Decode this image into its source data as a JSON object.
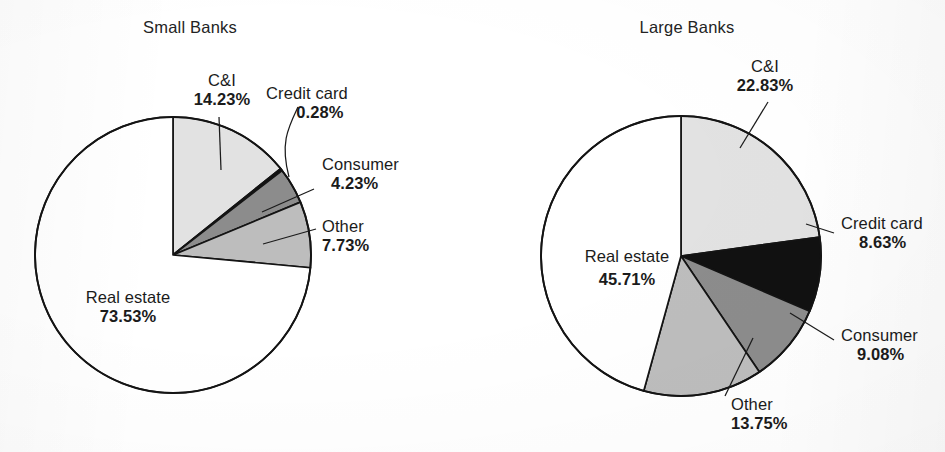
{
  "chart_data": [
    {
      "type": "pie",
      "title": "Small Banks",
      "categories": [
        "C&I",
        "Credit card",
        "Consumer",
        "Other",
        "Real estate"
      ],
      "values": [
        14.23,
        0.28,
        4.23,
        7.73,
        73.53
      ],
      "value_labels": [
        "14.23%",
        "0.28%",
        "4.23%",
        "7.73%",
        "73.53%"
      ],
      "colors": [
        "#e2e2e2",
        "#111111",
        "#8c8c8c",
        "#bdbdbd",
        "#ffffff"
      ],
      "start_angle_deg": 0,
      "direction": "clockwise",
      "legend": "none",
      "xlabel": "",
      "ylabel": ""
    },
    {
      "type": "pie",
      "title": "Large Banks",
      "categories": [
        "C&I",
        "Credit card",
        "Consumer",
        "Other",
        "Real estate"
      ],
      "values": [
        22.83,
        8.63,
        9.08,
        13.75,
        45.71
      ],
      "value_labels": [
        "22.83%",
        "8.63%",
        "9.08%",
        "13.75%",
        "45.71%"
      ],
      "colors": [
        "#e2e2e2",
        "#111111",
        "#8c8c8c",
        "#bdbdbd",
        "#ffffff"
      ],
      "start_angle_deg": 0,
      "direction": "clockwise",
      "legend": "none",
      "xlabel": "",
      "ylabel": ""
    }
  ],
  "small": {
    "title": "Small Banks",
    "labels": {
      "ci_name": "C&I",
      "ci_value": "14.23%",
      "credit_name": "Credit card",
      "credit_value": "0.28%",
      "consumer_name": "Consumer",
      "consumer_value": "4.23%",
      "other_name": "Other",
      "other_value": "7.73%",
      "realestate_name": "Real estate",
      "realestate_value": "73.53%"
    }
  },
  "large": {
    "title": "Large Banks",
    "labels": {
      "ci_name": "C&I",
      "ci_value": "22.83%",
      "credit_name": "Credit card",
      "credit_value": "8.63%",
      "consumer_name": "Consumer",
      "consumer_value": "9.08%",
      "other_name": "Other",
      "other_value": "13.75%",
      "realestate_name": "Real estate",
      "realestate_value": "45.71%"
    }
  }
}
